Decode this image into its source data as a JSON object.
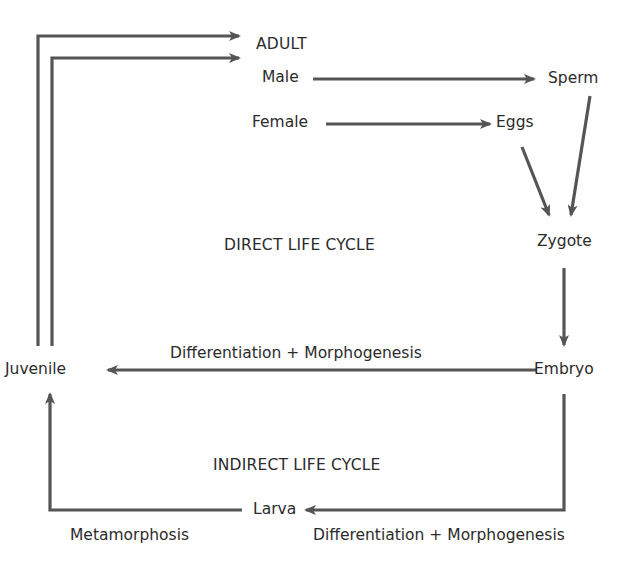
{
  "diagram": {
    "type": "life-cycle-flowchart",
    "colors": {
      "arrow": "#555555",
      "text": "#2b2b2b",
      "background": "#ffffff"
    },
    "nodes": {
      "adult": "ADULT",
      "male": "Male",
      "female": "Female",
      "sperm": "Sperm",
      "eggs": "Eggs",
      "zygote": "Zygote",
      "embryo": "Embryo",
      "juvenile": "Juvenile",
      "larva": "Larva"
    },
    "section_labels": {
      "direct": "DIRECT LIFE CYCLE",
      "indirect": "INDIRECT LIFE CYCLE"
    },
    "edge_labels": {
      "embryo_to_juvenile": "Differentiation + Morphogenesis",
      "embryo_to_larva": "Differentiation + Morphogenesis",
      "larva_to_juvenile": "Metamorphosis"
    },
    "edges": [
      {
        "from": "Juvenile",
        "to": "ADULT",
        "path": "outer"
      },
      {
        "from": "Juvenile",
        "to": "ADULT",
        "path": "inner"
      },
      {
        "from": "Male",
        "to": "Sperm"
      },
      {
        "from": "Female",
        "to": "Eggs"
      },
      {
        "from": "Sperm",
        "to": "Zygote"
      },
      {
        "from": "Eggs",
        "to": "Zygote"
      },
      {
        "from": "Zygote",
        "to": "Embryo"
      },
      {
        "from": "Embryo",
        "to": "Juvenile",
        "label": "Differentiation + Morphogenesis"
      },
      {
        "from": "Embryo",
        "to": "Larva",
        "label": "Differentiation + Morphogenesis"
      },
      {
        "from": "Larva",
        "to": "Juvenile",
        "label": "Metamorphosis"
      }
    ]
  }
}
